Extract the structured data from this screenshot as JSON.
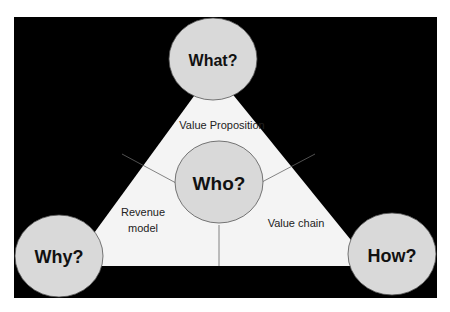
{
  "diagram": {
    "type": "magic-triangle",
    "background_color": "#000000",
    "triangle_fill": "#f4f4f4",
    "circle_fill": "#d9d9d9",
    "circles": {
      "top": "What?",
      "center": "Who?",
      "bottom_left": "Why?",
      "bottom_right": "How?"
    },
    "regions": {
      "top": "Value Proposition",
      "left_line1": "Revenue",
      "left_line2": "model",
      "right": "Value chain"
    }
  }
}
